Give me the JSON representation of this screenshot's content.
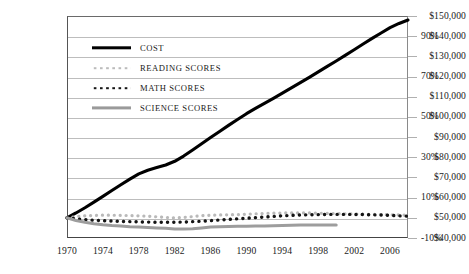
{
  "chart_data": {
    "type": "line",
    "title": "",
    "subtitle": "",
    "xlabel": "",
    "ylabel": "",
    "y2label": "",
    "grid": true,
    "legend_position": "inside-top-left",
    "x": [
      1970,
      1971,
      1972,
      1973,
      1974,
      1975,
      1976,
      1977,
      1978,
      1979,
      1980,
      1981,
      1982,
      1983,
      1984,
      1985,
      1986,
      1987,
      1988,
      1989,
      1990,
      1991,
      1992,
      1993,
      1994,
      1995,
      1996,
      1997,
      1998,
      1999,
      2000,
      2001,
      2002,
      2003,
      2004,
      2005,
      2006,
      2007,
      2008
    ],
    "xlim": [
      1970,
      2008
    ],
    "xticks": [
      1970,
      1974,
      1978,
      1982,
      1986,
      1990,
      1994,
      1998,
      2002,
      2006
    ],
    "xticklabels": [
      "1970",
      "1974",
      "1978",
      "1982",
      "1986",
      "1990",
      "1994",
      "1998",
      "2002",
      "2006"
    ],
    "yaxis_left": {
      "ylim": [
        40000,
        150000
      ],
      "ticks": [
        40000,
        50000,
        60000,
        70000,
        80000,
        90000,
        100000,
        110000,
        120000,
        130000,
        140000,
        150000
      ],
      "ticklabels": [
        "$40,000",
        "$50,000",
        "$60,000",
        "$70,000",
        "$80,000",
        "$90,000",
        "$100,000",
        "$110,000",
        "$120,000",
        "$130,000",
        "$140,000",
        "$150,000"
      ]
    },
    "yaxis_right": {
      "ylim": [
        -10,
        100
      ],
      "ticks": [
        -10,
        0,
        10,
        20,
        30,
        40,
        50,
        60,
        70,
        80,
        90,
        100
      ],
      "labeled_ticks": [
        -10,
        10,
        30,
        50,
        70,
        90
      ],
      "ticklabels": [
        "-10%",
        "10%",
        "30%",
        "50%",
        "70%",
        "90%"
      ]
    },
    "series": [
      {
        "name": "COST",
        "axis": "left",
        "style": "solid",
        "color": "#000000",
        "width": 3.1,
        "values": [
          50000,
          52400,
          55000,
          57800,
          60600,
          63500,
          66400,
          69200,
          71800,
          73600,
          74900,
          76200,
          78000,
          80600,
          83600,
          86700,
          89800,
          92800,
          95800,
          98700,
          101600,
          104200,
          106700,
          109200,
          111800,
          114400,
          117000,
          119600,
          122300,
          125000,
          127700,
          130500,
          133300,
          136100,
          138900,
          141600,
          144200,
          146300,
          148000
        ]
      },
      {
        "name": "READING SCORES",
        "axis": "right",
        "style": "dotted",
        "color": "#b9b9b9",
        "width": 3.2,
        "values": [
          0,
          0.6,
          1.0,
          1.2,
          1.3,
          1.3,
          1.2,
          1.1,
          1.0,
          0.8,
          0.5,
          0.2,
          0.0,
          0.2,
          0.6,
          1.0,
          1.3,
          1.4,
          1.5,
          1.6,
          1.8,
          2.0,
          2.2,
          2.3,
          2.4,
          2.4,
          2.4,
          2.4,
          2.3,
          2.2,
          2.1,
          2.0,
          1.9,
          1.8,
          1.7,
          1.6,
          1.5,
          1.4,
          1.3
        ]
      },
      {
        "name": "MATH SCORES",
        "axis": "right",
        "style": "dotted",
        "color": "#141414",
        "width": 3.4,
        "values": [
          0,
          -0.5,
          -0.9,
          -1.2,
          -1.4,
          -1.6,
          -1.8,
          -1.9,
          -2.0,
          -2.1,
          -2.2,
          -2.2,
          -2.2,
          -2.1,
          -1.9,
          -1.7,
          -1.4,
          -1.1,
          -0.8,
          -0.5,
          -0.2,
          0.1,
          0.4,
          0.7,
          1.0,
          1.2,
          1.4,
          1.5,
          1.6,
          1.7,
          1.7,
          1.7,
          1.7,
          1.6,
          1.5,
          1.4,
          1.2,
          1.0,
          0.8
        ]
      },
      {
        "name": "SCIENCE SCORES",
        "axis": "right",
        "style": "solid",
        "color": "#9d9d9d",
        "width": 3.0,
        "values": [
          0,
          -1.3,
          -2.2,
          -2.9,
          -3.4,
          -3.8,
          -4.1,
          -4.4,
          -4.6,
          -4.8,
          -5.0,
          -5.2,
          -5.5,
          -5.6,
          -5.4,
          -5.0,
          -4.6,
          -4.4,
          -4.3,
          -4.2,
          -4.2,
          -4.1,
          -4.0,
          -3.9,
          -3.8,
          -3.7,
          -3.6,
          -3.5,
          -3.5,
          -3.5,
          -3.5,
          null,
          null,
          null,
          null,
          null,
          null,
          null,
          null
        ]
      }
    ],
    "annotations": []
  },
  "legend": {
    "items": [
      {
        "label": "COST",
        "swatch": "solid-black-thick"
      },
      {
        "label": "READING SCORES",
        "swatch": "dotted-light-gray"
      },
      {
        "label": "MATH SCORES",
        "swatch": "dotted-black"
      },
      {
        "label": "SCIENCE SCORES",
        "swatch": "solid-gray"
      }
    ]
  },
  "colors": {
    "cost": "#000000",
    "reading": "#b9b9b9",
    "math": "#141414",
    "science": "#9d9d9d",
    "grid": "#bdbdbd",
    "axis": "#444444",
    "text": "#1a1a1a",
    "background": "#ffffff"
  }
}
